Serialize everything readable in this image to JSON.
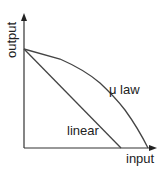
{
  "diagram": {
    "y_axis_label": "output",
    "x_axis_label": "input",
    "curves": [
      {
        "name": "linear",
        "label": "linear",
        "points": [
          [
            24,
            49
          ],
          [
            121,
            148
          ]
        ]
      },
      {
        "name": "mu-law",
        "label": "μ law",
        "points": [
          [
            24,
            49
          ],
          [
            60,
            59
          ],
          [
            100,
            83
          ],
          [
            125,
            110
          ],
          [
            148,
            148
          ]
        ]
      }
    ],
    "colors": {
      "line": "#333333",
      "axis": "#333333"
    }
  }
}
